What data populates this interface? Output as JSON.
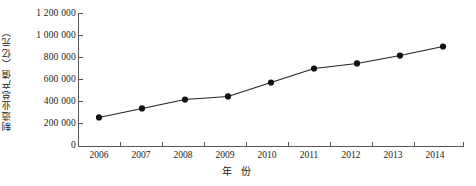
{
  "chart_data": {
    "type": "line",
    "title": "",
    "xlabel": "年  份",
    "ylabel": "制造业总产值（亿元）",
    "categories": [
      "2006",
      "2007",
      "2008",
      "2009",
      "2010",
      "2011",
      "2012",
      "2013",
      "2014"
    ],
    "x": [
      2006,
      2007,
      2008,
      2009,
      2010,
      2011,
      2012,
      2013,
      2014
    ],
    "values": [
      264000,
      346000,
      427000,
      455000,
      582000,
      709000,
      755000,
      827000,
      909000
    ],
    "series": [
      {
        "name": "制造业总产值",
        "values": [
          264000,
          346000,
          427000,
          455000,
          582000,
          709000,
          755000,
          827000,
          909000
        ]
      }
    ],
    "ylim": [
      0,
      1200000
    ],
    "ytick_values": [
      0,
      200000,
      400000,
      600000,
      800000,
      1000000,
      1200000
    ],
    "ytick_labels": [
      "0",
      "200 000",
      "400 000",
      "600 000",
      "800 000",
      "1 000 000",
      "1 200 000"
    ],
    "xtick_labels": [
      "2006",
      "2007",
      "2008",
      "2009",
      "2010",
      "2011",
      "2012",
      "2013",
      "2014"
    ],
    "grid": false,
    "legend": "none",
    "marker": "filled-circle",
    "line_color": "#222222",
    "marker_color": "#111111",
    "axis_color": "#555555"
  }
}
